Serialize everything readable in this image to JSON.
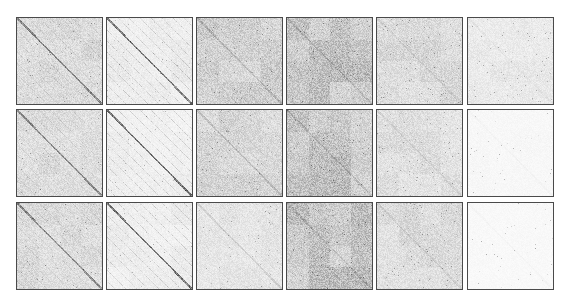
{
  "chart_data": {
    "type": "heatmap",
    "title": "",
    "xlabel": "",
    "ylabel": "",
    "legend": null,
    "grid": false,
    "colormap": "grayscale (white = low, dark = high)",
    "rows": 3,
    "cols": 6,
    "layout": {
      "col_x": [
        16,
        106,
        196,
        286,
        376,
        467
      ],
      "row_y": [
        17,
        109,
        202
      ],
      "panel_w": 87,
      "panel_h": 88,
      "border_color": "#4a4a4a"
    },
    "panels": [
      {
        "row": 0,
        "col": 0,
        "density": 0.3,
        "diagonal": 0.55,
        "offdiag": 0.25,
        "blocks": 0.25,
        "speckle": 0.15,
        "seed": 11
      },
      {
        "row": 0,
        "col": 1,
        "density": 0.16,
        "diagonal": 0.75,
        "offdiag": 0.45,
        "blocks": 0.35,
        "speckle": 0.06,
        "seed": 12
      },
      {
        "row": 0,
        "col": 2,
        "density": 0.38,
        "diagonal": 0.2,
        "offdiag": 0.2,
        "blocks": 0.3,
        "speckle": 0.2,
        "seed": 13
      },
      {
        "row": 0,
        "col": 3,
        "density": 0.5,
        "diagonal": 0.15,
        "offdiag": 0.15,
        "blocks": 0.4,
        "speckle": 0.25,
        "seed": 14
      },
      {
        "row": 0,
        "col": 4,
        "density": 0.3,
        "diagonal": 0.1,
        "offdiag": 0.1,
        "blocks": 0.3,
        "speckle": 0.22,
        "seed": 15
      },
      {
        "row": 0,
        "col": 5,
        "density": 0.18,
        "diagonal": 0.05,
        "offdiag": 0.05,
        "blocks": 0.25,
        "speckle": 0.15,
        "seed": 16
      },
      {
        "row": 1,
        "col": 0,
        "density": 0.28,
        "diagonal": 0.55,
        "offdiag": 0.25,
        "blocks": 0.25,
        "speckle": 0.14,
        "seed": 21
      },
      {
        "row": 1,
        "col": 1,
        "density": 0.14,
        "diagonal": 0.8,
        "offdiag": 0.45,
        "blocks": 0.4,
        "speckle": 0.05,
        "seed": 22
      },
      {
        "row": 1,
        "col": 2,
        "density": 0.34,
        "diagonal": 0.2,
        "offdiag": 0.18,
        "blocks": 0.3,
        "speckle": 0.2,
        "seed": 23
      },
      {
        "row": 1,
        "col": 3,
        "density": 0.48,
        "diagonal": 0.15,
        "offdiag": 0.15,
        "blocks": 0.4,
        "speckle": 0.25,
        "seed": 24
      },
      {
        "row": 1,
        "col": 4,
        "density": 0.26,
        "diagonal": 0.1,
        "offdiag": 0.1,
        "blocks": 0.3,
        "speckle": 0.2,
        "seed": 25
      },
      {
        "row": 1,
        "col": 5,
        "density": 0.06,
        "diagonal": 0.03,
        "offdiag": 0.03,
        "blocks": 0.15,
        "speckle": 0.08,
        "seed": 26
      },
      {
        "row": 2,
        "col": 0,
        "density": 0.28,
        "diagonal": 0.55,
        "offdiag": 0.25,
        "blocks": 0.25,
        "speckle": 0.14,
        "seed": 31
      },
      {
        "row": 2,
        "col": 1,
        "density": 0.15,
        "diagonal": 0.78,
        "offdiag": 0.45,
        "blocks": 0.38,
        "speckle": 0.05,
        "seed": 32
      },
      {
        "row": 2,
        "col": 2,
        "density": 0.2,
        "diagonal": 0.15,
        "offdiag": 0.15,
        "blocks": 0.2,
        "speckle": 0.15,
        "seed": 33
      },
      {
        "row": 2,
        "col": 3,
        "density": 0.48,
        "diagonal": 0.15,
        "offdiag": 0.15,
        "blocks": 0.4,
        "speckle": 0.25,
        "seed": 34
      },
      {
        "row": 2,
        "col": 4,
        "density": 0.28,
        "diagonal": 0.1,
        "offdiag": 0.1,
        "blocks": 0.3,
        "speckle": 0.22,
        "seed": 35
      },
      {
        "row": 2,
        "col": 5,
        "density": 0.05,
        "diagonal": 0.03,
        "offdiag": 0.03,
        "blocks": 0.15,
        "speckle": 0.08,
        "seed": 36
      }
    ]
  }
}
